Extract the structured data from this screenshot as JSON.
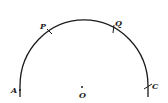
{
  "diagram": {
    "type": "circular-arc",
    "center": {
      "label": "O",
      "x": 81,
      "y": 86
    },
    "radius": 62,
    "points": [
      {
        "label": "A",
        "x": 19,
        "y": 89,
        "label_x": 11,
        "label_y": 93
      },
      {
        "label": "P",
        "x": 50,
        "y": 32,
        "label_x": 41,
        "label_y": 29
      },
      {
        "label": "Q",
        "x": 114,
        "y": 29,
        "label_x": 115,
        "label_y": 26
      },
      {
        "label": "C",
        "x": 148,
        "y": 86,
        "label_x": 151,
        "label_y": 88
      }
    ],
    "colors": {
      "stroke": "#1a1a1a",
      "background": "#ffffff"
    }
  }
}
